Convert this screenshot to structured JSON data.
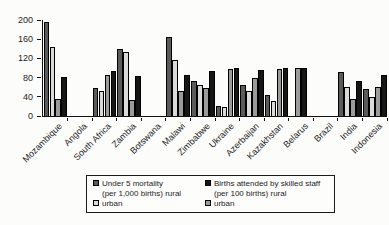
{
  "chart_data": {
    "type": "bar",
    "title": "",
    "xlabel": "",
    "ylabel": "",
    "ylim": [
      0,
      200
    ],
    "yticks": [
      0,
      40,
      80,
      120,
      160,
      200
    ],
    "grid": false,
    "legend_position": "bottom-box",
    "categories": [
      "Mozambique",
      "Angola",
      "South Africa",
      "Zambia",
      "Botswana",
      "Malawi",
      "Zimbabwe",
      "Ukraine",
      "Azerbaijan",
      "Kazakhstan",
      "Belarus",
      "Brazil",
      "India",
      "Indonesia"
    ],
    "series": [
      {
        "name": "Under 5 mortality (per 1,000 births) rural",
        "color": "#5b5b5b",
        "values": [
          193,
          null,
          56,
          138,
          null,
          162,
          71,
          19,
          62,
          42,
          null,
          null,
          89,
          55
        ]
      },
      {
        "name": "Under 5 mortality (per 1,000 births) urban",
        "color": "#dadada",
        "values": [
          141,
          null,
          50,
          131,
          null,
          115,
          63,
          16,
          50,
          29,
          null,
          null,
          58,
          38
        ]
      },
      {
        "name": "Births attended by skilled staff (per 100 births) urban",
        "color": "#9b9b9b",
        "values": [
          34,
          null,
          84,
          31,
          null,
          50,
          56,
          95,
          78,
          95,
          97,
          null,
          34,
          58
        ]
      },
      {
        "name": "Births attended by skilled staff (per 100 births) rural",
        "color": "#161616",
        "values": [
          80,
          null,
          92,
          82,
          null,
          83,
          92,
          97,
          94,
          97,
          97,
          null,
          70,
          83
        ]
      }
    ],
    "legend_entries": [
      {
        "swatch_color": "#5b5b5b",
        "line1": "Under 5 mortality",
        "line2": "(per 1,000 births) rural"
      },
      {
        "swatch_color": "#161616",
        "line1": "Births attended by skilled staff",
        "line2": "(per 100 births) rural"
      },
      {
        "swatch_color": "#dadada",
        "line1": "urban",
        "line2": ""
      },
      {
        "swatch_color": "#9b9b9b",
        "line1": "urban",
        "line2": ""
      }
    ]
  }
}
